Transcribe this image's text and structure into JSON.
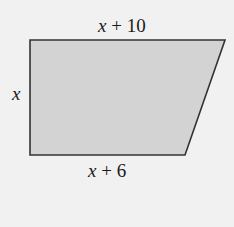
{
  "figure": {
    "shape": "trapezoid",
    "fill_color": "#d3d3d3",
    "stroke_color": "#333333",
    "background_color": "#f1f1f1",
    "labels": {
      "top": {
        "var": "x",
        "rest": " + 10"
      },
      "left": {
        "var": "x"
      },
      "bottom": {
        "var": "x",
        "rest": " + 6"
      }
    }
  }
}
